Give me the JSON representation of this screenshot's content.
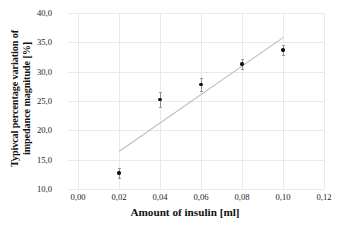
{
  "chart_data": {
    "type": "scatter",
    "title": "",
    "xlabel": "Amount of insulin [ml]",
    "ylabel_line1": "Typivcal percentage variation of",
    "ylabel_line2": "impedance magnitude [%]",
    "xlim": [
      0.0,
      0.12
    ],
    "ylim": [
      10.0,
      40.0
    ],
    "grid": true,
    "legend": "none",
    "x_tick_labels": [
      "0,00",
      "0,02",
      "0,04",
      "0,06",
      "0,08",
      "0,10",
      "0,12"
    ],
    "x_tick_values": [
      0.0,
      0.02,
      0.04,
      0.06,
      0.08,
      0.1,
      0.12
    ],
    "y_tick_labels": [
      "40,0",
      "35,0",
      "30,0",
      "25,0",
      "20,0",
      "15,0",
      "10,0"
    ],
    "y_tick_values": [
      40.0,
      35.0,
      30.0,
      25.0,
      20.0,
      15.0,
      10.0
    ],
    "x": [
      0.02,
      0.04,
      0.06,
      0.08,
      0.1
    ],
    "values": [
      12.7,
      25.3,
      27.8,
      31.3,
      33.7
    ],
    "yerr": [
      0.9,
      1.3,
      1.1,
      0.9,
      0.9
    ],
    "series": [
      {
        "name": "measurements",
        "marker": "circle",
        "color": "#111111",
        "x": [
          0.02,
          0.04,
          0.06,
          0.08,
          0.1
        ],
        "values": [
          12.7,
          25.3,
          27.8,
          31.3,
          33.7
        ],
        "yerr": [
          0.9,
          1.3,
          1.1,
          0.9,
          0.9
        ]
      },
      {
        "name": "trendline",
        "type": "line",
        "color": "#bdbdbd",
        "x": [
          0.02,
          0.1
        ],
        "values": [
          16.4,
          35.8
        ]
      }
    ],
    "colors": {
      "marker": "#111111",
      "errorbar": "#8d8d8d",
      "trendline": "#bdbdbd",
      "grid": "#e9e9e9",
      "text": "#111111",
      "background": "#ffffff"
    }
  }
}
